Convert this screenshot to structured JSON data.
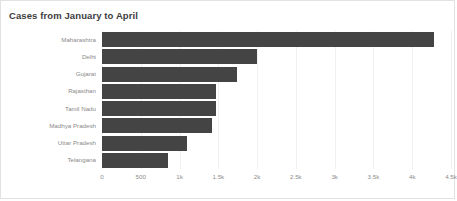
{
  "chart_data": {
    "type": "bar",
    "orientation": "horizontal",
    "title": "Cases from January to April",
    "xlabel": "",
    "ylabel": "",
    "categories": [
      "Maharashtra",
      "Delhi",
      "Gujarat",
      "Rajasthan",
      "Tamil Nadu",
      "Madhya Pradesh",
      "Uttar Pradesh",
      "Telangana"
    ],
    "values": [
      4280,
      2000,
      1740,
      1470,
      1470,
      1420,
      1100,
      850
    ],
    "series": [
      {
        "name": "Cases",
        "values": [
          4280,
          2000,
          1740,
          1470,
          1470,
          1420,
          1100,
          850
        ]
      }
    ],
    "xlim": [
      0,
      4500
    ],
    "xticks": [
      0,
      500,
      1000,
      1500,
      2000,
      2500,
      3000,
      3500,
      4000,
      4500
    ],
    "xticklabels": [
      "0",
      "500",
      "1k",
      "1.5k",
      "2k",
      "2.5k",
      "3k",
      "3.5k",
      "4k",
      "4.5k"
    ],
    "grid": true,
    "legend": false,
    "bar_color": "#444444",
    "grid_color": "#f0f0f0",
    "tick_label_color": "#8a8a8a",
    "title_color": "#3d3d3d",
    "background_color": "#ffffff",
    "border_color": "#e2e2e2"
  }
}
